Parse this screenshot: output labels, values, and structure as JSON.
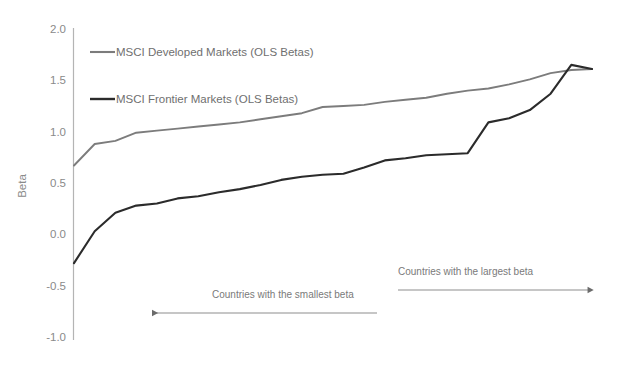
{
  "chart_data": {
    "type": "line",
    "title": "",
    "subtitle": "",
    "xlabel": "",
    "ylabel": "Beta",
    "ylim": [
      -1.0,
      2.0
    ],
    "yticks": [
      "2.0",
      "1.5",
      "1.0",
      "0.5",
      "0.0",
      "-0.5",
      "-1.0"
    ],
    "ytick_values": [
      2.0,
      1.5,
      1.0,
      0.5,
      0.0,
      -0.5,
      -1.0
    ],
    "grid": false,
    "xaxis_visible": false,
    "xticks": [],
    "legend_position": "upper-left-inside",
    "series": [
      {
        "name": "MSCI Developed Markets (OLS Betas)",
        "color": "#7c7c7c",
        "values": [
          0.68,
          0.89,
          0.92,
          1.0,
          1.02,
          1.04,
          1.06,
          1.08,
          1.1,
          1.13,
          1.16,
          1.19,
          1.25,
          1.26,
          1.27,
          1.3,
          1.32,
          1.34,
          1.38,
          1.41,
          1.43,
          1.47,
          1.52,
          1.58,
          1.61,
          1.62
        ]
      },
      {
        "name": "MSCI Frontier Markets (OLS Betas)",
        "color": "#2b2b2b",
        "values": [
          -0.27,
          0.04,
          0.22,
          0.29,
          0.31,
          0.36,
          0.38,
          0.42,
          0.45,
          0.49,
          0.54,
          0.57,
          0.59,
          0.6,
          0.66,
          0.73,
          0.75,
          0.78,
          0.79,
          0.8,
          1.1,
          1.14,
          1.22,
          1.38,
          1.66,
          1.62
        ]
      }
    ],
    "annotations": [
      {
        "text": "Countries with the smallest beta",
        "arrow_direction": "left"
      },
      {
        "text": "Countries with the largest beta",
        "arrow_direction": "right"
      }
    ]
  }
}
